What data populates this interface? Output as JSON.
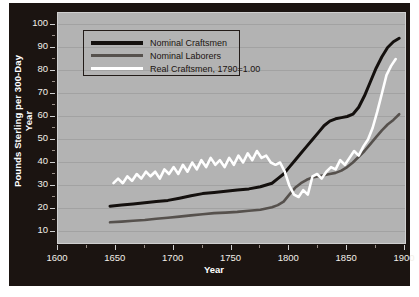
{
  "chart_data": {
    "type": "line",
    "title": "",
    "xlabel": "Year",
    "ylabel": "Pounds Sterling per 300-Day Year",
    "xlim": [
      1600,
      1900
    ],
    "ylim": [
      5,
      105
    ],
    "xticks": [
      1600,
      1650,
      1700,
      1750,
      1800,
      1850,
      1900
    ],
    "xminor_step": 25,
    "yticks": [
      10,
      20,
      30,
      40,
      50,
      60,
      70,
      80,
      90,
      100
    ],
    "grid": "horizontal",
    "legend_position": "upper-left",
    "plot_background": "#b3b3b3",
    "panel_background": "#1b1411",
    "series": [
      {
        "name": "Nominal Craftsmen",
        "color": "#14100e",
        "x": [
          1645,
          1655,
          1665,
          1675,
          1685,
          1695,
          1705,
          1715,
          1725,
          1735,
          1745,
          1755,
          1765,
          1775,
          1785,
          1790,
          1795,
          1800,
          1805,
          1810,
          1815,
          1820,
          1825,
          1830,
          1835,
          1840,
          1845,
          1850,
          1855,
          1860,
          1865,
          1870,
          1875,
          1880,
          1885,
          1890,
          1895
        ],
        "values": [
          21,
          21.5,
          22,
          22.5,
          23,
          23.5,
          24.5,
          25.5,
          26.5,
          27,
          27.5,
          28,
          28.5,
          29.5,
          31,
          33,
          35,
          38,
          41,
          44,
          47,
          50,
          53,
          56,
          58,
          59,
          59.5,
          60,
          61,
          64,
          69,
          75,
          81,
          86,
          90,
          92.5,
          94
        ]
      },
      {
        "name": "Nominal Laborers",
        "color": "#56514d",
        "x": [
          1645,
          1655,
          1665,
          1675,
          1685,
          1695,
          1705,
          1715,
          1725,
          1735,
          1745,
          1755,
          1765,
          1775,
          1785,
          1790,
          1795,
          1800,
          1805,
          1810,
          1815,
          1820,
          1825,
          1830,
          1835,
          1840,
          1845,
          1850,
          1855,
          1860,
          1865,
          1870,
          1875,
          1880,
          1885,
          1890,
          1895
        ],
        "values": [
          14,
          14.3,
          14.7,
          15,
          15.5,
          16,
          16.5,
          17,
          17.5,
          18,
          18.2,
          18.5,
          19,
          19.5,
          20.5,
          21.5,
          23,
          26,
          29,
          31,
          32.5,
          33.5,
          34,
          34.5,
          35,
          35.5,
          36.5,
          38,
          40,
          42.5,
          45,
          48,
          51,
          54,
          56.5,
          58.5,
          61
        ]
      },
      {
        "name": "Real Craftsmen, 1790=1.00",
        "color": "#ffffff",
        "x": [
          1648,
          1652,
          1656,
          1660,
          1664,
          1668,
          1672,
          1676,
          1680,
          1684,
          1688,
          1692,
          1696,
          1700,
          1704,
          1708,
          1712,
          1716,
          1720,
          1724,
          1728,
          1732,
          1736,
          1740,
          1744,
          1748,
          1752,
          1756,
          1760,
          1764,
          1768,
          1772,
          1776,
          1780,
          1784,
          1788,
          1792,
          1796,
          1800,
          1804,
          1808,
          1812,
          1816,
          1820,
          1824,
          1828,
          1832,
          1836,
          1840,
          1844,
          1848,
          1852,
          1856,
          1860,
          1864,
          1868,
          1872,
          1876,
          1880,
          1884,
          1888,
          1892
        ],
        "values": [
          31,
          33,
          31,
          34,
          32,
          35,
          33,
          36,
          34,
          36,
          33,
          37,
          35,
          38,
          35,
          39,
          36,
          40,
          37,
          41,
          38,
          42,
          39,
          41,
          38,
          42,
          39,
          43,
          40,
          44,
          41,
          45,
          42,
          43,
          40,
          39,
          40,
          36,
          30,
          26,
          25,
          28,
          26,
          34,
          35,
          33,
          36,
          38,
          37,
          41,
          39,
          42,
          45,
          43,
          47,
          50,
          55,
          62,
          70,
          78,
          82,
          85
        ]
      }
    ]
  },
  "axis_labels": {
    "y": [
      "100",
      "90",
      "80",
      "70",
      "60",
      "50",
      "40",
      "30",
      "20",
      "10"
    ],
    "x": [
      "1600",
      "1650",
      "1700",
      "1750",
      "1800",
      "1850",
      "1900"
    ]
  }
}
